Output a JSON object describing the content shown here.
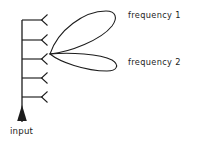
{
  "figure": {
    "background_color": "#ffffff",
    "stroke_color": "#1c1c1c",
    "labels": {
      "frequency_1": "frequency 1",
      "frequency_2": "frequency 2",
      "input": "input"
    },
    "feed_line": {
      "name": "vertical-feed-line",
      "x": 22,
      "y_top": 20,
      "y_bottom": 122
    },
    "input_arrow": {
      "name": "input-arrow",
      "direction": "up",
      "x": 22,
      "tip_y": 107,
      "base_y": 122
    },
    "array_elements": [
      {
        "index": 1,
        "branch_y": 20,
        "branch_x_start": 22,
        "branch_x_end": 43
      },
      {
        "index": 2,
        "branch_y": 40,
        "branch_x_start": 22,
        "branch_x_end": 43
      },
      {
        "index": 3,
        "branch_y": 59,
        "branch_x_start": 22,
        "branch_x_end": 43
      },
      {
        "index": 4,
        "branch_y": 78,
        "branch_x_start": 22,
        "branch_x_end": 43
      },
      {
        "index": 5,
        "branch_y": 97,
        "branch_x_start": 22,
        "branch_x_end": 43
      }
    ],
    "element_count": 5,
    "beam_origin": {
      "x": 50,
      "y": 54
    },
    "lobes": [
      {
        "name": "upper-beam-lobe",
        "label": "frequency 1",
        "tip": {
          "x": 116,
          "y": 13
        },
        "direction_deg": 24
      },
      {
        "name": "lower-beam-lobe",
        "label": "frequency 2",
        "tip": {
          "x": 119,
          "y": 69
        },
        "direction_deg": -8
      }
    ]
  }
}
